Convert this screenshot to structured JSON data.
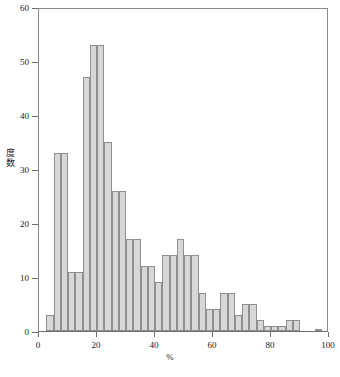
{
  "chart_data": {
    "type": "bar",
    "title": "",
    "subtitle": "",
    "xlabel": "%",
    "ylabel": "度数",
    "xlim": [
      0,
      100
    ],
    "ylim": [
      0,
      60
    ],
    "grid": false,
    "legend": null,
    "bin_width": 2.5,
    "xticks": [
      {
        "value": 0,
        "label": "0"
      },
      {
        "value": 20,
        "label": "20"
      },
      {
        "value": 40,
        "label": "40"
      },
      {
        "value": 60,
        "label": "60"
      },
      {
        "value": 80,
        "label": "80"
      },
      {
        "value": 100,
        "label": "100"
      }
    ],
    "yticks": [
      {
        "value": 0,
        "label": "0"
      },
      {
        "value": 10,
        "label": "10"
      },
      {
        "value": 20,
        "label": "20"
      },
      {
        "value": 30,
        "label": "30"
      },
      {
        "value": 40,
        "label": "40"
      },
      {
        "value": 50,
        "label": "50"
      },
      {
        "value": 60,
        "label": "60"
      }
    ],
    "bins": [
      {
        "x0": 2.5,
        "x1": 5.0,
        "value": 3
      },
      {
        "x0": 5.0,
        "x1": 7.5,
        "value": 33
      },
      {
        "x0": 7.5,
        "x1": 10.0,
        "value": 33
      },
      {
        "x0": 10.0,
        "x1": 12.5,
        "value": 11
      },
      {
        "x0": 12.5,
        "x1": 15.0,
        "value": 11
      },
      {
        "x0": 15.0,
        "x1": 17.5,
        "value": 47
      },
      {
        "x0": 17.5,
        "x1": 20.0,
        "value": 53
      },
      {
        "x0": 20.0,
        "x1": 22.5,
        "value": 53
      },
      {
        "x0": 22.5,
        "x1": 25.0,
        "value": 35
      },
      {
        "x0": 25.0,
        "x1": 27.5,
        "value": 26
      },
      {
        "x0": 27.5,
        "x1": 30.0,
        "value": 26
      },
      {
        "x0": 30.0,
        "x1": 32.5,
        "value": 17
      },
      {
        "x0": 32.5,
        "x1": 35.0,
        "value": 17
      },
      {
        "x0": 35.0,
        "x1": 37.5,
        "value": 12
      },
      {
        "x0": 37.5,
        "x1": 40.0,
        "value": 12
      },
      {
        "x0": 40.0,
        "x1": 42.5,
        "value": 9
      },
      {
        "x0": 42.5,
        "x1": 45.0,
        "value": 14
      },
      {
        "x0": 45.0,
        "x1": 47.5,
        "value": 14
      },
      {
        "x0": 47.5,
        "x1": 50.0,
        "value": 17
      },
      {
        "x0": 50.0,
        "x1": 52.5,
        "value": 14
      },
      {
        "x0": 52.5,
        "x1": 55.0,
        "value": 14
      },
      {
        "x0": 55.0,
        "x1": 57.5,
        "value": 7
      },
      {
        "x0": 57.5,
        "x1": 60.0,
        "value": 4
      },
      {
        "x0": 60.0,
        "x1": 62.5,
        "value": 4
      },
      {
        "x0": 62.5,
        "x1": 65.0,
        "value": 7
      },
      {
        "x0": 65.0,
        "x1": 67.5,
        "value": 7
      },
      {
        "x0": 67.5,
        "x1": 70.0,
        "value": 3
      },
      {
        "x0": 70.0,
        "x1": 72.5,
        "value": 5
      },
      {
        "x0": 72.5,
        "x1": 75.0,
        "value": 5
      },
      {
        "x0": 75.0,
        "x1": 77.5,
        "value": 2
      },
      {
        "x0": 77.5,
        "x1": 80.0,
        "value": 1
      },
      {
        "x0": 80.0,
        "x1": 82.5,
        "value": 1
      },
      {
        "x0": 82.5,
        "x1": 85.0,
        "value": 1
      },
      {
        "x0": 85.0,
        "x1": 87.5,
        "value": 2
      },
      {
        "x0": 87.5,
        "x1": 90.0,
        "value": 2
      },
      {
        "x0": 95.0,
        "x1": 97.5,
        "value": 0.2
      }
    ],
    "colors": {
      "bar_fill": "#d7d7d7",
      "bar_stroke": "#8f8f8f",
      "axis": "#6e6e6e",
      "text": "#1a1a1a"
    }
  },
  "caption": {
    "text": ""
  }
}
